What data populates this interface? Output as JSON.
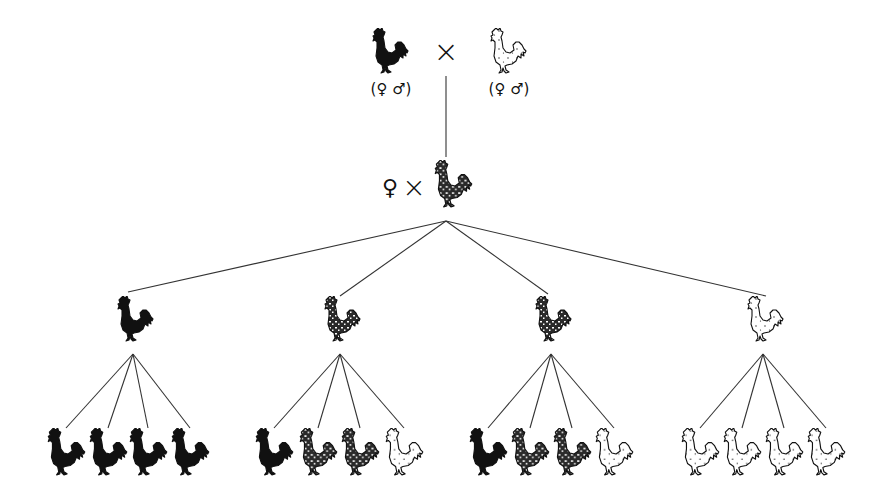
{
  "diagram": {
    "title": "",
    "symbols": {
      "cross": "×",
      "female": "♀",
      "male": "♂",
      "parent_label_left": "(♀ ♂)",
      "parent_label_right": "(♀ ♂)"
    },
    "colors": {
      "line": "#333333",
      "ink": "#111111",
      "background": "#ffffff"
    },
    "parents": [
      {
        "id": "p-black",
        "phenotype": "black",
        "label": "(♀ ♂)"
      },
      {
        "id": "p-white",
        "phenotype": "white",
        "label": "(♀ ♂)"
      }
    ],
    "f1": {
      "female_symbol": "♀",
      "cross_symbol": "×",
      "phenotype": "mottled"
    },
    "generation2": [
      {
        "phenotype": "black",
        "offspring": [
          "black",
          "black",
          "black",
          "black"
        ]
      },
      {
        "phenotype": "mottled",
        "offspring": [
          "black",
          "mottled",
          "mottled",
          "white"
        ]
      },
      {
        "phenotype": "mottled",
        "offspring": [
          "black",
          "mottled",
          "mottled",
          "white"
        ]
      },
      {
        "phenotype": "white",
        "offspring": [
          "white",
          "white",
          "white",
          "white"
        ]
      }
    ]
  }
}
